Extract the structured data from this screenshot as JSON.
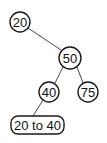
{
  "diagram": {
    "type": "binary-tree",
    "nodes": [
      {
        "id": "n20",
        "label": "20",
        "shape": "circle",
        "cx": 20,
        "cy": 22,
        "r": 10
      },
      {
        "id": "n50",
        "label": "50",
        "shape": "circle",
        "cx": 70,
        "cy": 58,
        "r": 11
      },
      {
        "id": "n40",
        "label": "40",
        "shape": "circle",
        "cx": 49,
        "cy": 92,
        "r": 10
      },
      {
        "id": "n75",
        "label": "75",
        "shape": "circle",
        "cx": 88,
        "cy": 92,
        "r": 10
      },
      {
        "id": "range",
        "label": "20 to 40",
        "shape": "rounded-rect",
        "x": 11,
        "y": 116,
        "w": 53,
        "h": 18
      }
    ],
    "edges": [
      {
        "from": "n20",
        "to": "n50"
      },
      {
        "from": "n50",
        "to": "n40"
      },
      {
        "from": "n50",
        "to": "n75"
      },
      {
        "from": "n40",
        "to": "range"
      }
    ]
  }
}
